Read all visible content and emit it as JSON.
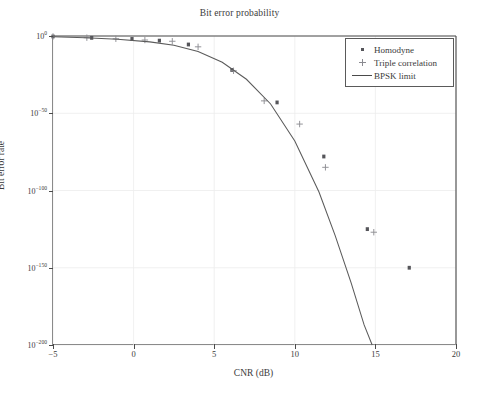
{
  "chart_data": {
    "type": "scatter",
    "title": "Bit error probability",
    "xlabel": "CNR (dB)",
    "ylabel": "Bit error rate",
    "xlim": [
      -5,
      20
    ],
    "ylim_log10": [
      -200,
      0
    ],
    "xticks": [
      -5,
      0,
      5,
      10,
      15,
      20
    ],
    "xtick_labels": [
      "−5",
      "0",
      "5",
      "10",
      "15",
      "20"
    ],
    "yticks_log10": [
      0,
      -50,
      -100,
      -150,
      -200
    ],
    "ytick_labels": [
      "10",
      "10",
      "10",
      "10",
      "10"
    ],
    "ytick_exponents": [
      "0",
      "−50",
      "−100",
      "−150",
      "−200"
    ],
    "yscale": "log",
    "grid": true,
    "legend_position": "upper right",
    "series": [
      {
        "name": "Homodyne",
        "marker": "square",
        "color": "#55555a",
        "points": [
          {
            "x": -5.0,
            "y_log10": -0.3
          },
          {
            "x": -2.6,
            "y_log10": -1.2
          },
          {
            "x": -0.1,
            "y_log10": -1.9
          },
          {
            "x": 1.6,
            "y_log10": -3.0
          },
          {
            "x": 3.4,
            "y_log10": -5.5
          },
          {
            "x": 6.1,
            "y_log10": -22.0
          },
          {
            "x": 8.9,
            "y_log10": -43.0
          },
          {
            "x": 11.8,
            "y_log10": -78.0
          },
          {
            "x": 14.5,
            "y_log10": -125.0
          },
          {
            "x": 17.1,
            "y_log10": -150.0
          }
        ]
      },
      {
        "name": "Triple correlation",
        "marker": "plus",
        "color": "#8e8e94",
        "points": [
          {
            "x": -5.0,
            "y_log10": -0.3
          },
          {
            "x": -2.9,
            "y_log10": -1.1
          },
          {
            "x": -1.1,
            "y_log10": -1.8
          },
          {
            "x": 0.7,
            "y_log10": -2.6
          },
          {
            "x": 2.4,
            "y_log10": -3.4
          },
          {
            "x": 4.0,
            "y_log10": -7.0
          },
          {
            "x": 6.2,
            "y_log10": -22.5
          },
          {
            "x": 8.1,
            "y_log10": -42.0
          },
          {
            "x": 10.3,
            "y_log10": -57.0
          },
          {
            "x": 11.9,
            "y_log10": -85.0
          },
          {
            "x": 14.9,
            "y_log10": -127.0
          }
        ]
      },
      {
        "name": "BPSK limit",
        "marker": "line",
        "color": "#5b5b5b",
        "points": [
          {
            "x": -5.0,
            "y_log10": -0.55
          },
          {
            "x": -3.0,
            "y_log10": -1.1
          },
          {
            "x": -1.0,
            "y_log10": -2.1
          },
          {
            "x": 1.0,
            "y_log10": -3.8
          },
          {
            "x": 2.5,
            "y_log10": -6.0
          },
          {
            "x": 4.0,
            "y_log10": -10.0
          },
          {
            "x": 5.5,
            "y_log10": -17.0
          },
          {
            "x": 7.0,
            "y_log10": -28.0
          },
          {
            "x": 8.5,
            "y_log10": -44.0
          },
          {
            "x": 10.0,
            "y_log10": -68.0
          },
          {
            "x": 11.5,
            "y_log10": -101.0
          },
          {
            "x": 12.5,
            "y_log10": -129.0
          },
          {
            "x": 13.5,
            "y_log10": -160.0
          },
          {
            "x": 14.3,
            "y_log10": -187.0
          },
          {
            "x": 14.8,
            "y_log10": -200.0
          }
        ]
      }
    ],
    "legend": [
      {
        "label": "Homodyne",
        "marker": "square"
      },
      {
        "label": "Triple correlation",
        "marker": "plus"
      },
      {
        "label": "BPSK limit",
        "marker": "line"
      }
    ]
  }
}
